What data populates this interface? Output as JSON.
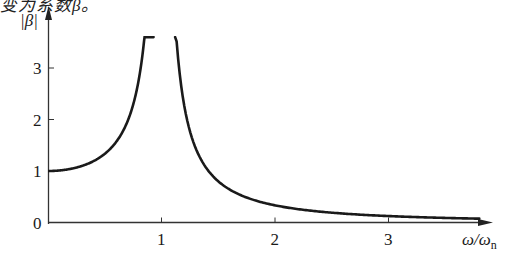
{
  "top_text": "变为系数β。",
  "chart_data": {
    "type": "line",
    "title": "",
    "xlabel": "ω/ωn",
    "xlabel_main": "ω/ω",
    "xlabel_sub": "n",
    "ylabel": "|β|",
    "xlim": [
      0,
      3.9
    ],
    "ylim": [
      0,
      3.6
    ],
    "x_ticks": [
      {
        "value": 1,
        "label": "1"
      },
      {
        "value": 2,
        "label": "2"
      },
      {
        "value": 3,
        "label": "3"
      }
    ],
    "y_ticks": [
      {
        "value": 0,
        "label": "0"
      },
      {
        "value": 1,
        "label": "1"
      },
      {
        "value": 2,
        "label": "2"
      },
      {
        "value": 3,
        "label": "3"
      }
    ],
    "grid": false,
    "legend": null,
    "formula": "|β| = 1 / |1 − (ω/ωn)²|",
    "series": [
      {
        "name": "|β| (ω < ωn)",
        "x": [
          0,
          0.1,
          0.2,
          0.3,
          0.4,
          0.5,
          0.6,
          0.7,
          0.8,
          0.85,
          0.9,
          0.93
        ],
        "values": [
          1.0,
          1.01,
          1.04,
          1.1,
          1.19,
          1.33,
          1.56,
          1.96,
          2.78,
          3.6,
          5.26,
          7.4
        ]
      },
      {
        "name": "|β| (ω > ωn)",
        "x": [
          1.12,
          1.15,
          1.2,
          1.3,
          1.5,
          1.75,
          2.0,
          2.5,
          3.0,
          3.5,
          3.8
        ],
        "values": [
          3.6,
          3.1,
          2.27,
          1.45,
          0.8,
          0.48,
          0.33,
          0.19,
          0.125,
          0.09,
          0.08
        ]
      }
    ]
  },
  "colors": {
    "curve": "#1a1a1a",
    "axis": "#333333"
  }
}
